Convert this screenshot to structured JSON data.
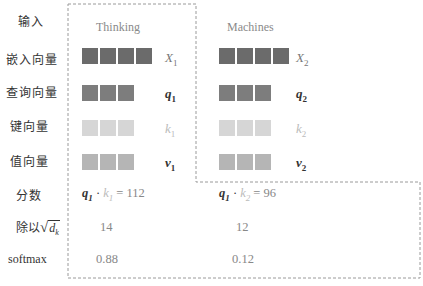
{
  "columns": [
    {
      "label": "Thinking",
      "index": "1"
    },
    {
      "label": "Machines",
      "index": "2"
    }
  ],
  "row_labels": {
    "input": "输入",
    "embedding": "嵌入向量",
    "query": "查询向量",
    "key": "键向量",
    "value": "值向量",
    "score": "分数",
    "divide": "除以",
    "divide_symbol": "d",
    "divide_symbol_sub": "k",
    "softmax": "softmax"
  },
  "vectors": {
    "embedding": {
      "symbol": "X",
      "cells": 4,
      "color": "#6b6b6b"
    },
    "query": {
      "symbol": "q",
      "cells": 3,
      "color": "#7d7d7d"
    },
    "key": {
      "symbol": "k",
      "cells": 3,
      "color": "#d6d6d6"
    },
    "value": {
      "symbol": "v",
      "cells": 3,
      "color": "#b5b5b5"
    }
  },
  "results": [
    {
      "q": "q",
      "q_sub": "1",
      "dot": "·",
      "k": "k",
      "k_sub": "1",
      "eq": "=",
      "score": "112",
      "scaled": "14",
      "softmax": "0.88"
    },
    {
      "q": "q",
      "q_sub": "1",
      "dot": "·",
      "k": "k",
      "k_sub": "2",
      "eq": "=",
      "score": "96",
      "scaled": "12",
      "softmax": "0.12"
    }
  ],
  "colors": {
    "outline": "#9a9a9a",
    "dark": "#6b6b6b",
    "medium": "#7d7d7d",
    "light": "#d6d6d6",
    "value": "#b5b5b5"
  }
}
